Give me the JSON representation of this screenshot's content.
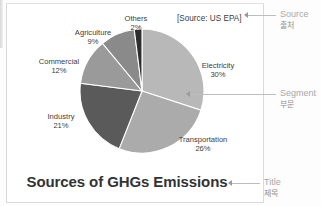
{
  "chart_data": {
    "type": "pie",
    "title": "Sources of GHGs Emissions",
    "source_note": "[Source: US EPA]",
    "categories": [
      "Electricity",
      "Transportation",
      "Industry",
      "Commercial",
      "Agriculture",
      "Others"
    ],
    "values": [
      30,
      26,
      21,
      12,
      9,
      2
    ],
    "unit": "%",
    "legend": "none",
    "labels_position": "outside",
    "slices": [
      {
        "name": "Electricity",
        "percent": 30,
        "percent_label": "30%",
        "color": "#b8b8b8"
      },
      {
        "name": "Transportation",
        "percent": 26,
        "percent_label": "26%",
        "color": "#ababab"
      },
      {
        "name": "Industry",
        "percent": 21,
        "percent_label": "21%",
        "color": "#5a5a5a"
      },
      {
        "name": "Commercial",
        "percent": 12,
        "percent_label": "12%",
        "color": "#9a9a9a"
      },
      {
        "name": "Agriculture",
        "percent": 9,
        "percent_label": "9%",
        "color": "#8a8a8a"
      },
      {
        "name": "Others",
        "percent": 2,
        "percent_label": "2%",
        "color": "#2e2e2e"
      }
    ]
  },
  "annotations": [
    {
      "key": "source",
      "en": "Source",
      "ko": "출처"
    },
    {
      "key": "segment",
      "en": "Segment",
      "ko": "부문"
    },
    {
      "key": "title",
      "en": "Title",
      "ko": "제목"
    }
  ],
  "colors": {
    "page_background": "#fdfdfd",
    "slide_background": "#ffffff",
    "frame_border": "#d9d9d9",
    "label_text": "#3d3d3d",
    "title_text": "#333333",
    "annotation_text": "#a8a8a8",
    "leader_line": "#bdbdbd"
  }
}
